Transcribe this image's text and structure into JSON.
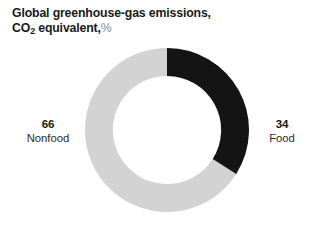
{
  "title": {
    "line1": "Global greenhouse-gas emissions,",
    "line2_main": "CO",
    "line2_sub": "2",
    "line2_rest": " equivalent,",
    "line2_unit": "%"
  },
  "labels": {
    "left": {
      "value": "66",
      "name": "Nonfood"
    },
    "right": {
      "value": "34",
      "name": "Food"
    }
  },
  "colors": {
    "food": "#141414",
    "nonfood": "#d3d3d3",
    "background": "#ffffff",
    "title_text": "#19191a",
    "unit_text": "#8e9194"
  },
  "chart_data": {
    "type": "pie",
    "variant": "donut",
    "xlabel": "",
    "ylabel": "",
    "unit": "%",
    "total": 100,
    "start_angle_deg": 0,
    "direction": "clockwise",
    "inner_radius_ratio": 0.66,
    "legend": "outside-labels",
    "grid": false,
    "categories": [
      "Food",
      "Nonfood"
    ],
    "values": [
      34,
      66
    ],
    "series": [
      {
        "name": "Share of global greenhouse-gas emissions",
        "values": [
          34,
          66
        ]
      }
    ],
    "slices": [
      {
        "label": "Food",
        "value": 34,
        "color": "#141414",
        "start_angle_deg": 0,
        "sweep_deg": 122.4,
        "label_position": "right"
      },
      {
        "label": "Nonfood",
        "value": 66,
        "color": "#d3d3d3",
        "start_angle_deg": 122.4,
        "sweep_deg": 237.6,
        "label_position": "left"
      }
    ]
  }
}
